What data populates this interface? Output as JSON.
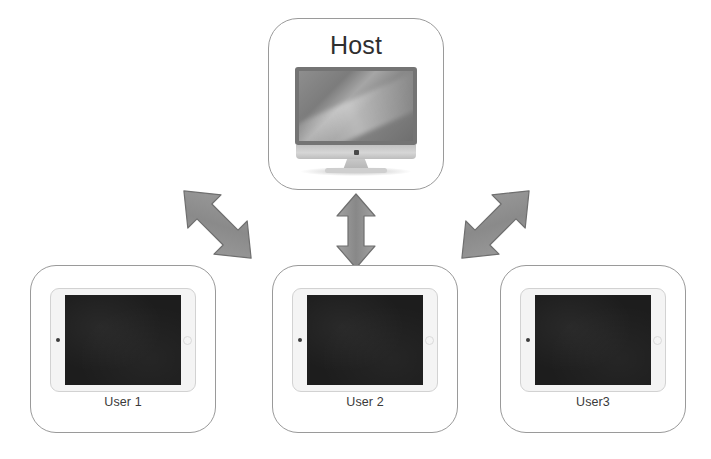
{
  "diagram": {
    "background_color": "#ffffff",
    "arrow_color": "#8c8c8c",
    "arrow_stroke_color": "#6f6f6f",
    "box_border_color": "#9a9a9a"
  },
  "host": {
    "label": "Host",
    "device_icon": "desktop-computer-icon",
    "device_type": "desktop monitor"
  },
  "users": [
    {
      "label": "User 1",
      "device_icon": "tablet-icon",
      "device_type": "tablet"
    },
    {
      "label": "User 2",
      "device_icon": "tablet-icon",
      "device_type": "tablet"
    },
    {
      "label": "User3",
      "device_icon": "tablet-icon",
      "device_type": "tablet"
    }
  ],
  "connections": [
    {
      "icon": "double-arrow-diagonal-up-right-icon",
      "from": "User 1",
      "to": "Host",
      "direction": "bidirectional"
    },
    {
      "icon": "double-arrow-vertical-icon",
      "from": "User 2",
      "to": "Host",
      "direction": "bidirectional"
    },
    {
      "icon": "double-arrow-diagonal-up-left-icon",
      "from": "User3",
      "to": "Host",
      "direction": "bidirectional"
    }
  ]
}
